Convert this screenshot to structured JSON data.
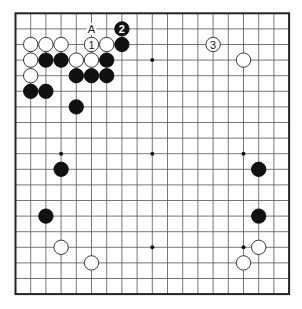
{
  "board": {
    "size": 19,
    "origin_x": 15.5,
    "origin_y": 13.3,
    "spacing_x": 15.2,
    "spacing_y": 15.6,
    "stone_radius": 7.2,
    "colors": {
      "black": "#111111",
      "white": "#ffffff",
      "line": "#555555",
      "border": "#222222"
    },
    "star_points": [
      [
        3,
        3
      ],
      [
        9,
        3
      ],
      [
        15,
        3
      ],
      [
        3,
        9
      ],
      [
        9,
        9
      ],
      [
        15,
        9
      ],
      [
        3,
        15
      ],
      [
        9,
        15
      ],
      [
        15,
        15
      ]
    ],
    "stones": [
      {
        "color": "white",
        "col": 1,
        "row": 2
      },
      {
        "color": "white",
        "col": 2,
        "row": 2
      },
      {
        "color": "white",
        "col": 3,
        "row": 2
      },
      {
        "color": "white",
        "col": 5,
        "row": 2,
        "label": "1"
      },
      {
        "color": "white",
        "col": 6,
        "row": 2
      },
      {
        "color": "black",
        "col": 7,
        "row": 2
      },
      {
        "color": "black",
        "col": 7,
        "row": 1,
        "label": "2"
      },
      {
        "color": "white",
        "col": 1,
        "row": 3
      },
      {
        "color": "black",
        "col": 2,
        "row": 3
      },
      {
        "color": "black",
        "col": 3,
        "row": 3
      },
      {
        "color": "white",
        "col": 4,
        "row": 3
      },
      {
        "color": "white",
        "col": 5,
        "row": 3
      },
      {
        "color": "black",
        "col": 6,
        "row": 3
      },
      {
        "color": "white",
        "col": 1,
        "row": 4
      },
      {
        "color": "black",
        "col": 4,
        "row": 4
      },
      {
        "color": "black",
        "col": 5,
        "row": 4
      },
      {
        "color": "black",
        "col": 6,
        "row": 4
      },
      {
        "color": "black",
        "col": 1,
        "row": 5
      },
      {
        "color": "black",
        "col": 2,
        "row": 5
      },
      {
        "color": "black",
        "col": 4,
        "row": 6
      },
      {
        "color": "white",
        "col": 13,
        "row": 2,
        "label": "3"
      },
      {
        "color": "white",
        "col": 15,
        "row": 3
      },
      {
        "color": "black",
        "col": 3,
        "row": 10
      },
      {
        "color": "black",
        "col": 2,
        "row": 13
      },
      {
        "color": "white",
        "col": 3,
        "row": 15
      },
      {
        "color": "white",
        "col": 5,
        "row": 16
      },
      {
        "color": "black",
        "col": 16,
        "row": 10
      },
      {
        "color": "black",
        "col": 16,
        "row": 13
      },
      {
        "color": "white",
        "col": 16,
        "row": 15
      },
      {
        "color": "white",
        "col": 15,
        "row": 16
      }
    ],
    "markers": [
      {
        "text": "A",
        "col": 5,
        "row": 1
      }
    ]
  }
}
